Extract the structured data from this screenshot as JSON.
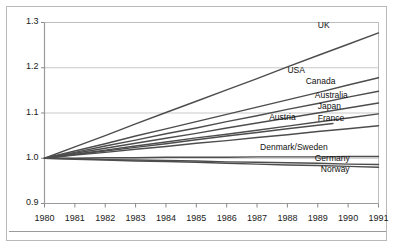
{
  "chart_data": {
    "type": "line",
    "title": "",
    "subtitle": "",
    "xlabel": "",
    "ylabel": "",
    "x": [
      1980,
      1981,
      1982,
      1983,
      1984,
      1985,
      1986,
      1987,
      1988,
      1989,
      1990,
      1991
    ],
    "xlim": [
      1980,
      1991
    ],
    "ylim": [
      0.9,
      1.3
    ],
    "yticks": [
      "0.9",
      "1.0",
      "1.1",
      "1.2",
      "1.3"
    ],
    "ytick_values": [
      0.9,
      1.0,
      1.1,
      1.2,
      1.3
    ],
    "xticks": [
      "1980",
      "1981",
      "1982",
      "1983",
      "1984",
      "1985",
      "1986",
      "1987",
      "1988",
      "1989",
      "1990",
      "1991"
    ],
    "grid": "horizontal",
    "legend": "inline-end-labels",
    "line_color": "#4d4d4d",
    "grid_color": "#c9c9c9",
    "axis_color": "#8a8a8a",
    "background": "#ffffff",
    "series": [
      {
        "name": "UK",
        "label": "UK",
        "label_x": 1989.0,
        "label_y": 1.292,
        "x_start": 1980,
        "x_end": 1991,
        "y_start": 1.0,
        "y_end": 1.277,
        "values": [
          1.0,
          1.025,
          1.05,
          1.076,
          1.101,
          1.126,
          1.151,
          1.176,
          1.202,
          1.227,
          1.252,
          1.277
        ]
      },
      {
        "name": "USA",
        "label": "USA",
        "label_x": 1988.0,
        "label_y": 1.192,
        "x_start": 1980,
        "x_end": 1991,
        "y_start": 1.0,
        "y_end": 1.178,
        "values": [
          1.0,
          1.016,
          1.032,
          1.049,
          1.065,
          1.081,
          1.097,
          1.113,
          1.129,
          1.145,
          1.162,
          1.178
        ]
      },
      {
        "name": "Canada",
        "label": "Canada",
        "label_x": 1988.6,
        "label_y": 1.168,
        "x_start": 1980,
        "x_end": 1991,
        "y_start": 1.0,
        "y_end": 1.148,
        "values": [
          1.0,
          1.013,
          1.027,
          1.04,
          1.054,
          1.067,
          1.081,
          1.094,
          1.108,
          1.121,
          1.135,
          1.148
        ]
      },
      {
        "name": "Australia",
        "label": "Australia",
        "label_x": 1988.9,
        "label_y": 1.138,
        "x_start": 1980,
        "x_end": 1991,
        "y_start": 1.0,
        "y_end": 1.122,
        "values": [
          1.0,
          1.011,
          1.022,
          1.033,
          1.044,
          1.055,
          1.067,
          1.078,
          1.089,
          1.1,
          1.111,
          1.122
        ]
      },
      {
        "name": "Japan",
        "label": "Japan",
        "label_x": 1989.0,
        "label_y": 1.113,
        "x_start": 1980,
        "x_end": 1991,
        "y_start": 1.0,
        "y_end": 1.098,
        "values": [
          1.0,
          1.009,
          1.018,
          1.027,
          1.036,
          1.045,
          1.053,
          1.062,
          1.071,
          1.08,
          1.089,
          1.098
        ]
      },
      {
        "name": "Austria",
        "label": "Austria",
        "label_x": 1987.4,
        "label_y": 1.088,
        "x_start": 1980,
        "x_end": 1989.5,
        "y_start": 1.0,
        "y_end": 1.077,
        "values": [
          1.0,
          1.008,
          1.016,
          1.024,
          1.032,
          1.041,
          1.049,
          1.057,
          1.065,
          1.073,
          1.077,
          null
        ]
      },
      {
        "name": "France",
        "label": "France",
        "label_x": 1989.0,
        "label_y": 1.086,
        "x_start": 1980,
        "x_end": 1991,
        "y_start": 1.0,
        "y_end": 1.072,
        "values": [
          1.0,
          1.007,
          1.013,
          1.02,
          1.026,
          1.033,
          1.039,
          1.046,
          1.052,
          1.059,
          1.065,
          1.072
        ]
      },
      {
        "name": "Denmark/Sweden",
        "label": "Denmark/Sweden",
        "label_x": 1987.1,
        "label_y": 1.022,
        "x_start": 1980,
        "x_end": 1991,
        "y_start": 1.0,
        "y_end": 1.004,
        "values": [
          1.0,
          1.0,
          1.001,
          1.001,
          1.002,
          1.002,
          1.002,
          1.003,
          1.003,
          1.003,
          1.004,
          1.004
        ]
      },
      {
        "name": "Germany",
        "label": "Germany",
        "label_x": 1988.9,
        "label_y": 0.998,
        "x_start": 1980,
        "x_end": 1991,
        "y_start": 1.0,
        "y_end": 0.986,
        "values": [
          1.0,
          0.999,
          0.997,
          0.996,
          0.995,
          0.994,
          0.992,
          0.991,
          0.99,
          0.989,
          0.987,
          0.986
        ]
      },
      {
        "name": "Norway",
        "label": "Norway",
        "label_x": 1989.1,
        "label_y": 0.973,
        "x_start": 1980,
        "x_end": 1991,
        "y_start": 1.0,
        "y_end": 0.98,
        "values": [
          1.0,
          0.998,
          0.996,
          0.994,
          0.993,
          0.991,
          0.989,
          0.987,
          0.985,
          0.984,
          0.982,
          0.98
        ]
      }
    ]
  }
}
